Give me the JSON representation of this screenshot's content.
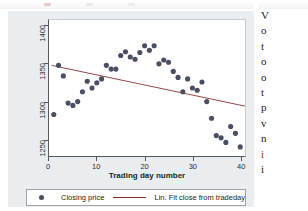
{
  "figure": {
    "background_color": "#e9edf0",
    "plot_background_color": "#ffffff",
    "marker_color": "#4a4e63",
    "fit_line_color": "#8b2f2f",
    "axis_color": "#555a60"
  },
  "axes": {
    "x_title": "Trading day number",
    "x_ticks": [
      "0",
      "10",
      "20",
      "30",
      "40"
    ],
    "y_ticks": [
      "1250",
      "1300",
      "1350",
      "1400"
    ]
  },
  "legend": {
    "marker_label": "Closing price",
    "line_label": "Lin. Fit close from tradeday"
  },
  "text_column": {
    "lines": [
      "V",
      "o",
      "t",
      "o",
      "o",
      "t",
      "p",
      "v",
      "n",
      "i",
      "i"
    ],
    "accent_line_index": 9
  },
  "chart_data": {
    "type": "scatter",
    "title": "",
    "xlabel": "Trading day number",
    "ylabel": "",
    "xlim": [
      0,
      41
    ],
    "ylim": [
      1228,
      1408
    ],
    "grid": false,
    "legend_position": "bottom",
    "series": [
      {
        "name": "Closing price",
        "type": "scatter",
        "marker_color": "#4a4e63",
        "x": [
          1,
          2,
          3,
          4,
          5,
          6,
          7,
          8,
          9,
          10,
          11,
          12,
          13,
          14,
          15,
          16,
          17,
          18,
          19,
          20,
          21,
          22,
          23,
          24,
          25,
          26,
          27,
          28,
          29,
          30,
          31,
          32,
          33,
          34,
          35,
          36,
          37,
          38,
          39,
          40
        ],
        "y": [
          1283,
          1348,
          1334,
          1298,
          1295,
          1300,
          1313,
          1327,
          1318,
          1325,
          1330,
          1348,
          1343,
          1343,
          1361,
          1366,
          1359,
          1356,
          1365,
          1374,
          1368,
          1374,
          1350,
          1355,
          1352,
          1340,
          1332,
          1313,
          1330,
          1318,
          1315,
          1326,
          1300,
          1278,
          1255,
          1252,
          1246,
          1267,
          1258,
          1240
        ]
      },
      {
        "name": "Lin. Fit close from tradeday",
        "type": "line",
        "line_color": "#8b2f2f",
        "x": [
          0.5,
          41
        ],
        "y": [
          1348,
          1294
        ]
      }
    ]
  }
}
